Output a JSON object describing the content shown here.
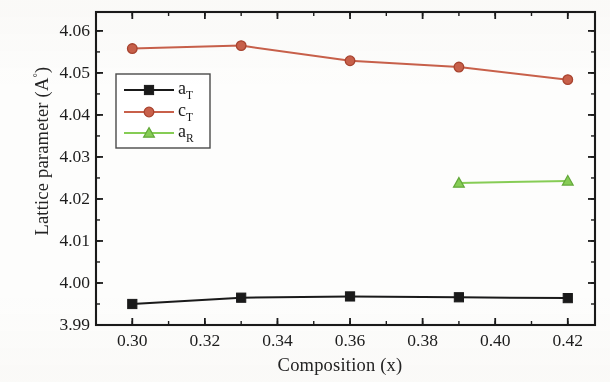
{
  "chart_data": {
    "type": "line",
    "title": "",
    "xlabel": "Composition (x)",
    "ylabel": "Lattice parameter (A°)",
    "xlim": [
      0.29,
      0.4275
    ],
    "ylim": [
      3.99,
      4.0645
    ],
    "grid": false,
    "legend_position": "upper-left-inside",
    "xticks": [
      "0.30",
      "0.32",
      "0.34",
      "0.36",
      "0.38",
      "0.40",
      "0.42"
    ],
    "xtick_values": [
      0.3,
      0.32,
      0.34,
      0.36,
      0.38,
      0.4,
      0.42
    ],
    "xminor_step": 0.01,
    "yticks": [
      "3.99",
      "4.00",
      "4.01",
      "4.02",
      "4.03",
      "4.04",
      "4.05",
      "4.06"
    ],
    "ytick_values": [
      3.99,
      4.0,
      4.01,
      4.02,
      4.03,
      4.04,
      4.05,
      4.06
    ],
    "yminor_step": 0.005,
    "series": [
      {
        "name": "a_T",
        "legend_label": "a",
        "legend_sub": "T",
        "color": "#1a1a1a",
        "marker": "square",
        "x": [
          0.3,
          0.33,
          0.36,
          0.39,
          0.42
        ],
        "values": [
          3.995,
          3.9965,
          3.9968,
          3.9966,
          3.9964
        ]
      },
      {
        "name": "c_T",
        "legend_label": "c",
        "legend_sub": "T",
        "color": "#c8604a",
        "marker": "circle",
        "x": [
          0.3,
          0.33,
          0.36,
          0.39,
          0.42
        ],
        "values": [
          4.0558,
          4.0565,
          4.0529,
          4.0514,
          4.0484
        ]
      },
      {
        "name": "a_R",
        "legend_label": "a",
        "legend_sub": "R",
        "color": "#86cc55",
        "marker": "triangle",
        "x": [
          0.39,
          0.42
        ],
        "values": [
          4.0238,
          4.0243
        ]
      }
    ]
  },
  "axes": {
    "y_title_main": "Lattice parameter (A",
    "y_title_deg": "°",
    "y_title_close": ")",
    "x_title": "Composition (x)"
  },
  "colors": {
    "axis": "#1a1a1a",
    "series_a_T": "#1a1a1a",
    "series_c_T": "#c8604a",
    "series_a_R": "#86cc55",
    "background": "#ffffff"
  }
}
